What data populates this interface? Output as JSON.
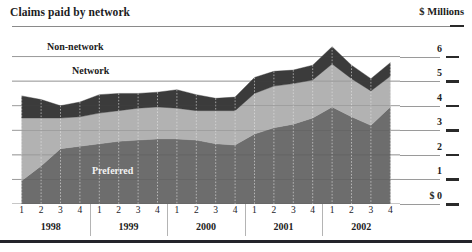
{
  "header": {
    "title": "Claims paid by network",
    "unit_label": "$ Millions"
  },
  "series_labels": {
    "non_network": "Non-network",
    "network": "Network",
    "preferred": "Preferred"
  },
  "chart_data": {
    "type": "area",
    "stacked": true,
    "title": "Claims paid by network",
    "xlabel": "",
    "ylabel": "$ Millions",
    "ylim": [
      0,
      7
    ],
    "yticks": [
      0,
      1,
      2,
      3,
      4,
      5,
      6
    ],
    "ytick_labels": [
      "$ 0",
      "1",
      "2",
      "3",
      "4",
      "5",
      "6"
    ],
    "grid": true,
    "legend": "in-plot",
    "years": [
      "1998",
      "1999",
      "2000",
      "2001",
      "2002"
    ],
    "quarters": [
      "1",
      "2",
      "3",
      "4"
    ],
    "x": [
      "1998 Q1",
      "1998 Q2",
      "1998 Q3",
      "1998 Q4",
      "1999 Q1",
      "1999 Q2",
      "1999 Q3",
      "1999 Q4",
      "2000 Q1",
      "2000 Q2",
      "2000 Q3",
      "2000 Q4",
      "2001 Q1",
      "2001 Q2",
      "2001 Q3",
      "2001 Q4",
      "2002 Q1",
      "2002 Q2",
      "2002 Q3",
      "2002 Q4"
    ],
    "series": [
      {
        "name": "Preferred",
        "color": "#6d6d6d",
        "values": [
          0.95,
          1.55,
          2.25,
          2.35,
          2.45,
          2.55,
          2.6,
          2.65,
          2.65,
          2.6,
          2.45,
          2.4,
          2.85,
          3.1,
          3.25,
          3.5,
          3.95,
          3.55,
          3.2,
          3.95
        ]
      },
      {
        "name": "Network",
        "color": "#b2b2b2",
        "values": [
          2.55,
          1.95,
          1.25,
          1.2,
          1.25,
          1.25,
          1.3,
          1.3,
          1.25,
          1.2,
          1.35,
          1.4,
          1.65,
          1.7,
          1.65,
          1.55,
          1.75,
          1.55,
          1.4,
          1.25
        ]
      },
      {
        "name": "Non-network",
        "color": "#3b3b3b",
        "values": [
          0.9,
          0.75,
          0.5,
          0.6,
          0.75,
          0.7,
          0.6,
          0.6,
          0.75,
          0.65,
          0.5,
          0.55,
          0.65,
          0.6,
          0.55,
          0.6,
          0.7,
          0.55,
          0.5,
          0.55
        ]
      }
    ],
    "totals": [
      4.4,
      4.25,
      4.0,
      4.15,
      4.45,
      4.5,
      4.5,
      4.55,
      4.65,
      4.45,
      4.3,
      4.35,
      5.15,
      5.4,
      5.45,
      5.65,
      6.4,
      5.65,
      5.1,
      5.75
    ]
  },
  "colors": {
    "preferred": "#6d6d6d",
    "network": "#b2b2b2",
    "non_network": "#3b3b3b",
    "gridline": "#9a9a9a",
    "rule": "#23232a",
    "background": "#ffffff"
  }
}
